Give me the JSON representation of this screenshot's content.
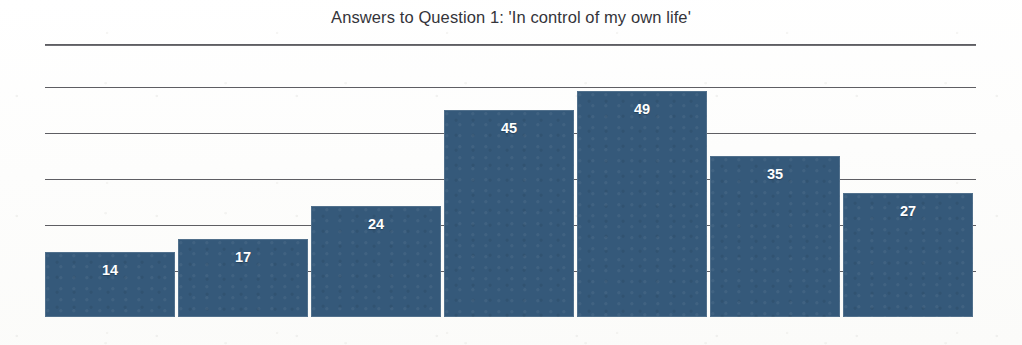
{
  "chart_data": {
    "type": "bar",
    "title": "Answers to Question 1: 'In control of my own life'",
    "categories": [
      "1",
      "2",
      "3",
      "4",
      "5",
      "6",
      "7"
    ],
    "values": [
      14,
      17,
      24,
      45,
      49,
      35,
      27
    ],
    "data_labels": [
      "14",
      "17",
      "24",
      "45",
      "49",
      "35",
      "27"
    ],
    "xlabel": "",
    "ylabel": "",
    "ylim": [
      0,
      60
    ],
    "gridlines": [
      10,
      20,
      30,
      40,
      50
    ],
    "grid": true,
    "tick_labels_visible": false,
    "legend": null,
    "bar_color": "#35597A",
    "label_color": "#FFFFFF",
    "title_color": "#34343A",
    "gridline_color": "#5E5E63"
  },
  "layout": {
    "title_rule_visible": true,
    "background": "#FEFEFE"
  }
}
